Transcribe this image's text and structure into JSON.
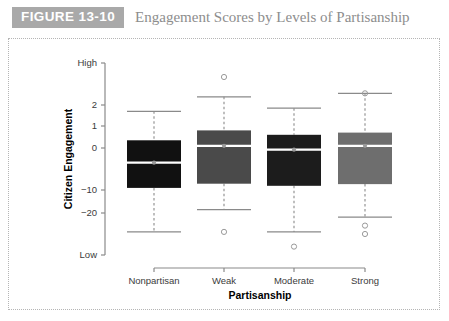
{
  "figure": {
    "badge": "FIGURE 13-10",
    "title": "Engagement Scores by Levels of Partisanship"
  },
  "colors": {
    "badge_bg": "#a9a9a9",
    "title_text": "#8d8d8d",
    "panel_border": "#b5b5b5",
    "axis_line": "#8a8a8a",
    "whisker": "#8a8a8a",
    "median_line": "#ffffff",
    "median_dot": "#9a9a9a",
    "outlier_stroke": "#9a9a9a",
    "box_nonpartisan": "#111111",
    "box_weak": "#4a4a4a",
    "box_moderate": "#1c1c1c",
    "box_strong": "#6e6e6e"
  },
  "chart_data": {
    "type": "box",
    "title": "Engagement Scores by Levels of Partisanship",
    "xlabel": "Partisanship",
    "ylabel": "Citizen Engagement",
    "grid": false,
    "legend": "none",
    "categories": [
      "Nonpartisan",
      "Weak",
      "Moderate",
      "Strong"
    ],
    "ytick_labels": [
      "High",
      "2",
      "1",
      "0",
      "-10",
      "-20",
      "Low"
    ],
    "ytick_values": [
      3.8,
      2,
      1,
      0,
      -10,
      -20,
      -30
    ],
    "ylim": [
      -30,
      3.8
    ],
    "boxes": [
      {
        "category": "Nonpartisan",
        "fill": "#111111",
        "whisker_high": 1.7,
        "q3": 0.35,
        "median": -3.5,
        "q1": -9.5,
        "whisker_low": -24.5,
        "outliers": []
      },
      {
        "category": "Weak",
        "fill": "#4a4a4a",
        "whisker_high": 2.35,
        "q3": 0.8,
        "median": 0.1,
        "q1": -8.5,
        "whisker_low": -18.5,
        "outliers": [
          3.2,
          -24.5
        ]
      },
      {
        "category": "Moderate",
        "fill": "#1c1c1c",
        "whisker_high": 1.85,
        "q3": 0.6,
        "median": -0.4,
        "q1": -9.0,
        "whisker_low": -24.5,
        "outliers": [
          -28.0
        ]
      },
      {
        "category": "Strong",
        "fill": "#6e6e6e",
        "whisker_high": 2.5,
        "q3": 0.7,
        "median": 0.1,
        "q1": -8.6,
        "whisker_low": -21.0,
        "outliers": [
          2.5,
          -23.0,
          -25.0
        ]
      }
    ]
  }
}
